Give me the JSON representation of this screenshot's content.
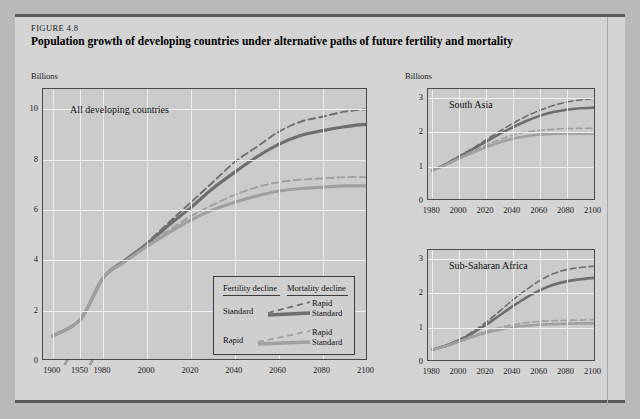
{
  "figure": {
    "number": "FIGURE 4.8",
    "title": "Population growth of developing countries under alternative paths of future fertility and mortality",
    "unit_label_left": "Billions",
    "unit_label_right": "Billions"
  },
  "legend": {
    "header_left": "Fertility decline",
    "header_right": "Mortality decline",
    "rows": [
      {
        "fertility": "Standard",
        "mortality_dashed": "Rapid",
        "mortality_solid": "Standard"
      },
      {
        "fertility": "Rapid",
        "mortality_dashed": "Rapid",
        "mortality_solid": "Standard"
      }
    ]
  },
  "colors": {
    "dark_series": "#6e6e6e",
    "light_series": "#a0a0a0",
    "plot_bg": "#cbcbcb",
    "figure_bg": "#d4d4d4",
    "grid": "#efefef",
    "frame": "#4a4a4a"
  },
  "chart_data": [
    {
      "id": "all-developing-countries",
      "type": "line",
      "title": "All developing countries",
      "ylabel": "Billions",
      "xlabel": "",
      "ylim": [
        0,
        10.8
      ],
      "yticks": [
        0,
        2,
        4,
        6,
        8,
        10
      ],
      "xticks": [
        1900,
        1950,
        1980,
        2000,
        2020,
        2040,
        2060,
        2080,
        2100
      ],
      "axis_breaks": [
        1925,
        1965
      ],
      "grid": true,
      "legend_position": "inside-lower-right",
      "series": [
        {
          "name": "Standard fertility / Rapid mortality",
          "style": "dashed",
          "color": "#6e6e6e",
          "x": [
            1900,
            1950,
            1980,
            1990,
            2000,
            2010,
            2020,
            2030,
            2040,
            2050,
            2060,
            2070,
            2080,
            2090,
            2100
          ],
          "values": [
            1.0,
            1.65,
            3.3,
            4.0,
            4.7,
            5.5,
            6.3,
            7.1,
            7.9,
            8.5,
            9.1,
            9.5,
            9.7,
            9.9,
            10.0
          ]
        },
        {
          "name": "Standard fertility / Standard mortality",
          "style": "solid",
          "color": "#6e6e6e",
          "x": [
            1900,
            1950,
            1980,
            1990,
            2000,
            2010,
            2020,
            2030,
            2040,
            2050,
            2060,
            2070,
            2080,
            2090,
            2100
          ],
          "values": [
            1.0,
            1.65,
            3.3,
            4.0,
            4.65,
            5.4,
            6.1,
            6.85,
            7.5,
            8.1,
            8.6,
            8.95,
            9.15,
            9.3,
            9.4
          ]
        },
        {
          "name": "Rapid fertility / Rapid mortality",
          "style": "dashed",
          "color": "#a0a0a0",
          "x": [
            1900,
            1950,
            1980,
            1990,
            2000,
            2010,
            2020,
            2030,
            2040,
            2050,
            2060,
            2070,
            2080,
            2090,
            2100
          ],
          "values": [
            1.0,
            1.65,
            3.3,
            3.95,
            4.6,
            5.2,
            5.75,
            6.2,
            6.6,
            6.9,
            7.1,
            7.2,
            7.25,
            7.3,
            7.3
          ]
        },
        {
          "name": "Rapid fertility / Standard mortality",
          "style": "solid",
          "color": "#a0a0a0",
          "x": [
            1900,
            1950,
            1980,
            1990,
            2000,
            2010,
            2020,
            2030,
            2040,
            2050,
            2060,
            2070,
            2080,
            2090,
            2100
          ],
          "values": [
            1.0,
            1.65,
            3.3,
            3.95,
            4.55,
            5.1,
            5.6,
            6.0,
            6.3,
            6.55,
            6.75,
            6.85,
            6.9,
            6.95,
            6.95
          ]
        }
      ]
    },
    {
      "id": "south-asia",
      "type": "line",
      "title": "South Asia",
      "ylabel": "Billions",
      "xlabel": "",
      "ylim": [
        0,
        3.25
      ],
      "yticks": [
        0,
        1,
        2,
        3
      ],
      "xticks": [
        1980,
        2000,
        2020,
        2040,
        2060,
        2080,
        2100
      ],
      "grid": true,
      "series": [
        {
          "name": "Standard fertility / Rapid mortality",
          "style": "dashed",
          "color": "#6e6e6e",
          "x": [
            1980,
            1990,
            2000,
            2010,
            2020,
            2030,
            2040,
            2050,
            2060,
            2070,
            2080,
            2090,
            2100
          ],
          "values": [
            0.88,
            1.08,
            1.3,
            1.53,
            1.77,
            2.02,
            2.25,
            2.46,
            2.63,
            2.77,
            2.87,
            2.93,
            2.97
          ]
        },
        {
          "name": "Standard fertility / Standard mortality",
          "style": "solid",
          "color": "#6e6e6e",
          "x": [
            1980,
            1990,
            2000,
            2010,
            2020,
            2030,
            2040,
            2050,
            2060,
            2070,
            2080,
            2090,
            2100
          ],
          "values": [
            0.88,
            1.07,
            1.28,
            1.5,
            1.72,
            1.94,
            2.14,
            2.32,
            2.47,
            2.58,
            2.65,
            2.69,
            2.71
          ]
        },
        {
          "name": "Rapid fertility / Rapid mortality",
          "style": "dashed",
          "color": "#a0a0a0",
          "x": [
            1980,
            1990,
            2000,
            2010,
            2020,
            2030,
            2040,
            2050,
            2060,
            2070,
            2080,
            2090,
            2100
          ],
          "values": [
            0.88,
            1.06,
            1.25,
            1.44,
            1.62,
            1.78,
            1.91,
            2.0,
            2.05,
            2.08,
            2.1,
            2.11,
            2.11
          ]
        },
        {
          "name": "Rapid fertility / Standard mortality",
          "style": "solid",
          "color": "#a0a0a0",
          "x": [
            1980,
            1990,
            2000,
            2010,
            2020,
            2030,
            2040,
            2050,
            2060,
            2070,
            2080,
            2090,
            2100
          ],
          "values": [
            0.88,
            1.05,
            1.23,
            1.4,
            1.56,
            1.7,
            1.81,
            1.88,
            1.93,
            1.95,
            1.96,
            1.96,
            1.96
          ]
        }
      ]
    },
    {
      "id": "sub-saharan-africa",
      "type": "line",
      "title": "Sub-Saharan Africa",
      "ylabel": "",
      "xlabel": "",
      "ylim": [
        0,
        3.25
      ],
      "yticks": [
        0,
        1,
        2,
        3
      ],
      "xticks": [
        1980,
        2000,
        2020,
        2040,
        2060,
        2080,
        2100
      ],
      "grid": true,
      "series": [
        {
          "name": "Standard fertility / Rapid mortality",
          "style": "dashed",
          "color": "#6e6e6e",
          "x": [
            1980,
            1990,
            2000,
            2010,
            2020,
            2030,
            2040,
            2050,
            2060,
            2070,
            2080,
            2090,
            2100
          ],
          "values": [
            0.36,
            0.48,
            0.65,
            0.88,
            1.15,
            1.47,
            1.8,
            2.1,
            2.36,
            2.56,
            2.68,
            2.74,
            2.78
          ]
        },
        {
          "name": "Standard fertility / Standard mortality",
          "style": "solid",
          "color": "#6e6e6e",
          "x": [
            1980,
            1990,
            2000,
            2010,
            2020,
            2030,
            2040,
            2050,
            2060,
            2070,
            2080,
            2090,
            2100
          ],
          "values": [
            0.36,
            0.47,
            0.63,
            0.84,
            1.08,
            1.35,
            1.62,
            1.87,
            2.08,
            2.24,
            2.34,
            2.4,
            2.44
          ]
        },
        {
          "name": "Rapid fertility / Rapid mortality",
          "style": "dashed",
          "color": "#a0a0a0",
          "x": [
            1980,
            1990,
            2000,
            2010,
            2020,
            2030,
            2040,
            2050,
            2060,
            2070,
            2080,
            2090,
            2100
          ],
          "values": [
            0.36,
            0.47,
            0.61,
            0.76,
            0.89,
            1.0,
            1.08,
            1.14,
            1.18,
            1.2,
            1.21,
            1.22,
            1.23
          ]
        },
        {
          "name": "Rapid fertility / Standard mortality",
          "style": "solid",
          "color": "#a0a0a0",
          "x": [
            1980,
            1990,
            2000,
            2010,
            2020,
            2030,
            2040,
            2050,
            2060,
            2070,
            2080,
            2090,
            2100
          ],
          "values": [
            0.36,
            0.46,
            0.59,
            0.73,
            0.85,
            0.94,
            1.01,
            1.05,
            1.08,
            1.1,
            1.11,
            1.12,
            1.12
          ]
        }
      ]
    }
  ]
}
